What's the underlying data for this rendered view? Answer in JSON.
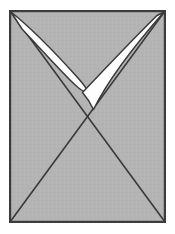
{
  "figure": {
    "canvas": {
      "width": 175,
      "height": 234
    },
    "colors": {
      "page_background": "#ffffff",
      "panel_fill": "#b4b4b4",
      "panel_border": "#3c3c3c",
      "diagonal_stroke": "#3a3a3a",
      "shape_fill": "#fdfdfd",
      "shape_outline": "#3a3a3a",
      "texture": "#a9a9a9"
    },
    "panel": {
      "name": "gray-panel",
      "left": 9,
      "top": 10,
      "right": 166,
      "bottom": 223,
      "border_width": 2.2
    },
    "diagonals": {
      "name": "diagonal-cross",
      "stroke_width": 1.6,
      "lines": [
        {
          "name": "diagonal-tl-br",
          "x1": 10,
          "y1": 11,
          "x2": 165,
          "y2": 222
        },
        {
          "name": "diagonal-tr-bl",
          "x1": 165,
          "y1": 11,
          "x2": 10,
          "y2": 222
        }
      ],
      "crossing_point": {
        "x": 88,
        "y": 117
      }
    },
    "checkmark": {
      "name": "white-checkmark",
      "tip": {
        "x": 92,
        "y": 110
      },
      "hook": {
        "x": 86,
        "y": 90
      },
      "left_wing": {
        "name": "checkmark-left-wing",
        "path": "M 11 12 C 28 25 58 55 80 80 C 86 87 88 90 86 91 C 83 92 76 86 68 79 C 58 70 40 50 27 35 Z",
        "outline_width": 1.5
      },
      "right_wing": {
        "name": "checkmark-right-wing",
        "path": "M 164 12 C 140 38 108 78 92 109 C 89 103 85 97 82 93 C 98 76 135 37 158 15 Z",
        "outline_width": 1.5
      }
    },
    "notes": {
      "shape_count": 2,
      "diagonal_count": 2
    }
  }
}
